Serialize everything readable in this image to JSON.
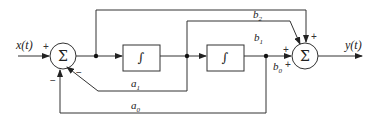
{
  "diagram": {
    "type": "block-diagram",
    "input": {
      "label": "x(t)"
    },
    "output": {
      "label": "y(t)"
    },
    "summers": [
      {
        "id": "sum1",
        "symbol": "Σ",
        "signs": {
          "input": "+",
          "a1": "−",
          "a0": "−"
        }
      },
      {
        "id": "sum2",
        "symbol": "Σ",
        "signs": {
          "b2": "+",
          "b1": "+",
          "b0": "+"
        }
      }
    ],
    "integrators": [
      {
        "id": "int1",
        "symbol": "∫"
      },
      {
        "id": "int2",
        "symbol": "∫"
      }
    ],
    "gains": {
      "b2": "b2",
      "b1": "b1",
      "b0": "b0",
      "a1": "a1",
      "a0": "a0"
    },
    "labels": {
      "x": "x(t)",
      "y": "y(t)",
      "b2_base": "b",
      "b2_sub": "2",
      "b1_base": "b",
      "b1_sub": "1",
      "b0_base": "b",
      "b0_sub": "0",
      "a1_base": "a",
      "a1_sub": "1",
      "a0_base": "a",
      "a0_sub": "0",
      "plus": "+",
      "minus": "−",
      "sigma": "Σ",
      "integral": "∫"
    }
  }
}
